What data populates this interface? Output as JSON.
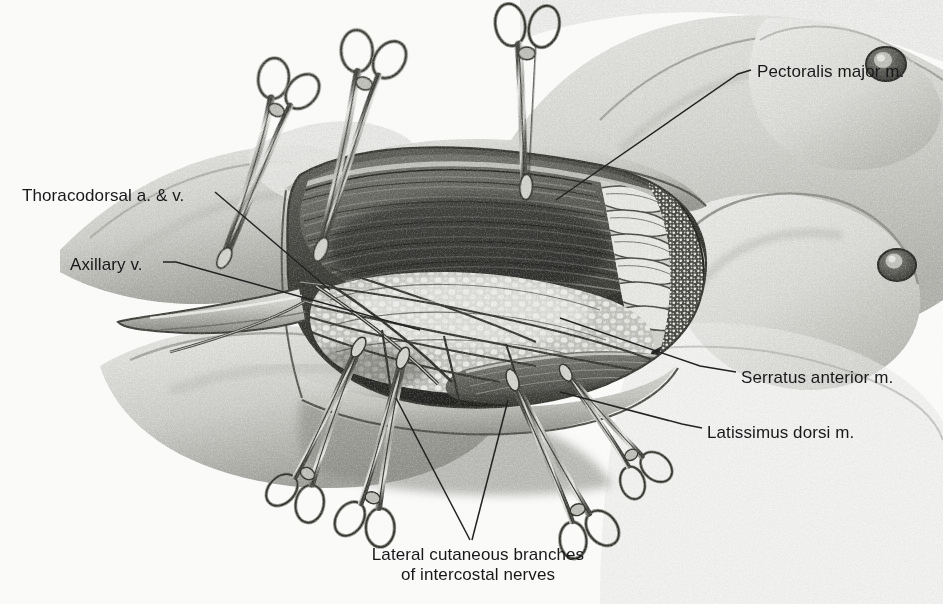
{
  "figure": {
    "background_color": "#fbfbfa",
    "ink_color": "#18181a",
    "medium": "halftone pen-and-ink / airbrush medical illustration",
    "width": 943,
    "height": 604
  },
  "labels": {
    "pectoralis": "Pectoralis major m.",
    "thoracodorsal": "Thoracodorsal a. & v.",
    "axillary": "Axillary v.",
    "serratus": "Serratus anterior m.",
    "latissimus": "Latissimus dorsi m.",
    "nerves_line1": "Lateral cutaneous branches",
    "nerves_line2": "of intercostal nerves"
  },
  "structures": [
    {
      "name": "pectoralis-major-muscle",
      "description": "retracted muscle flap with striated fibers at upper wound margin"
    },
    {
      "name": "serratus-anterior-muscle",
      "description": "digitations on lateral chest wall"
    },
    {
      "name": "latissimus-dorsi-muscle",
      "description": "lateral border of axillary wound"
    },
    {
      "name": "axillary-vein",
      "description": "tubular vessel passing to the left apex of the field"
    },
    {
      "name": "thoracodorsal-vessels",
      "description": "artery and vein descending into the axilla"
    },
    {
      "name": "intercostal-nerve-branches",
      "description": "lateral cutaneous branches crossing the floor"
    },
    {
      "name": "breast",
      "description": "two breast contours with nipple-areolar complexes on the right"
    },
    {
      "name": "axillary-fat-pad",
      "description": "stippled nodular fatty tissue within the wound"
    }
  ],
  "instruments": {
    "type": "hemostat-clamp",
    "count": 7,
    "placement": "clamped along skin-flap edges of the axillary incision"
  }
}
